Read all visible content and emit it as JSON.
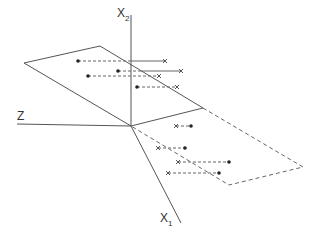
{
  "diagram": {
    "title": "",
    "axes": {
      "x2": {
        "label": "X",
        "subscript": "2"
      },
      "z": {
        "label": "Z",
        "subscript": ""
      },
      "x1": {
        "label": "X",
        "subscript": "1"
      }
    },
    "planes": [
      {
        "name": "upper-plane",
        "style": "solid"
      },
      {
        "name": "lower-plane",
        "style": "dashed"
      }
    ],
    "upper_pairs_count": 4,
    "lower_pairs_count": 4,
    "marker_legend": {
      "dot": "point",
      "cross": "projection"
    }
  }
}
